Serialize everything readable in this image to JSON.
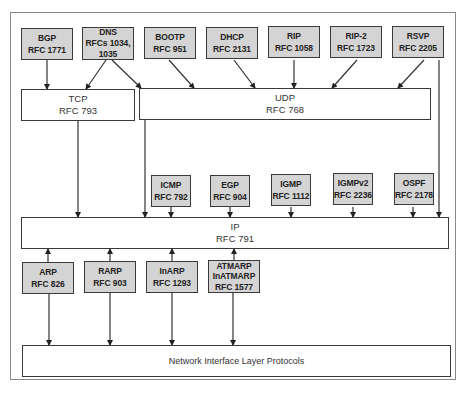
{
  "diagram": {
    "type": "protocol-stack",
    "application_protocols": [
      {
        "name": "BGP",
        "rfc": "RFC 1771",
        "targets": [
          "TCP"
        ]
      },
      {
        "name": "DNS",
        "rfc": "RFCs 1034,",
        "rfc2": "1035",
        "targets": [
          "TCP",
          "UDP"
        ]
      },
      {
        "name": "BOOTP",
        "rfc": "RFC 951",
        "targets": [
          "UDP"
        ]
      },
      {
        "name": "DHCP",
        "rfc": "RFC 2131",
        "targets": [
          "UDP"
        ]
      },
      {
        "name": "RIP",
        "rfc": "RFC 1058",
        "targets": [
          "UDP"
        ]
      },
      {
        "name": "RIP-2",
        "rfc": "RFC 1723",
        "targets": [
          "UDP"
        ]
      },
      {
        "name": "RSVP",
        "rfc": "RFC 2205",
        "targets": [
          "UDP",
          "IP"
        ]
      }
    ],
    "transport": [
      {
        "name": "TCP",
        "rfc": "RFC 793",
        "targets": [
          "IP"
        ]
      },
      {
        "name": "UDP",
        "rfc": "RFC 768",
        "targets": [
          "IP"
        ]
      }
    ],
    "internet_protocols": [
      {
        "name": "ICMP",
        "rfc": "RFC 792",
        "targets": [
          "IP"
        ]
      },
      {
        "name": "EGP",
        "rfc": "RFC 904",
        "targets": [
          "IP"
        ]
      },
      {
        "name": "IGMP",
        "rfc": "RFC 1112",
        "targets": [
          "IP"
        ]
      },
      {
        "name": "IGMPv2",
        "rfc": "RFC 2236",
        "targets": [
          "IP"
        ]
      },
      {
        "name": "OSPF",
        "rfc": "RFC 2178",
        "targets": [
          "IP"
        ]
      }
    ],
    "ip": {
      "name": "IP",
      "rfc": "RFC 791"
    },
    "link_protocols": [
      {
        "name": "ARP",
        "rfc": "RFC 826",
        "targets": [
          "IP",
          "Network Interface Layer Protocols"
        ]
      },
      {
        "name": "RARP",
        "rfc": "RFC 903",
        "targets": [
          "IP",
          "Network Interface Layer Protocols"
        ]
      },
      {
        "name": "InARP",
        "rfc": "RFC 1293",
        "targets": [
          "IP",
          "Network Interface Layer Protocols"
        ]
      },
      {
        "name": "ATMARP",
        "name2": "InATMARP",
        "rfc": "RFC 1577",
        "targets": [
          "IP",
          "Network Interface Layer Protocols"
        ]
      }
    ],
    "network_interface": {
      "name": "Network Interface Layer Protocols"
    },
    "colors": {
      "protocol_fill": "#d4d4d4",
      "layer_fill": "#ffffff",
      "stroke": "#3a3a3a"
    }
  }
}
